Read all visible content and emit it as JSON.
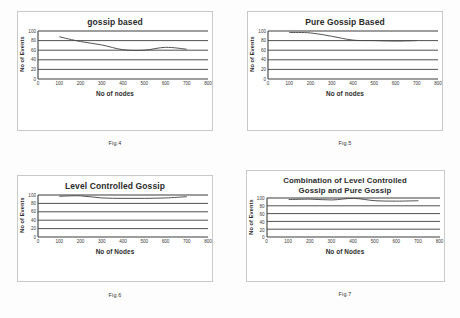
{
  "page": {
    "background": "#fdfdfd",
    "figure_count": 4
  },
  "figures": [
    {
      "caption": "Fig.4",
      "chart_data": {
        "type": "line",
        "title": "gossip based",
        "xlabel": "No of nodes",
        "ylabel": "No of Events",
        "xlim": [
          0,
          800
        ],
        "ylim": [
          0,
          100
        ],
        "xticks": [
          0,
          100,
          200,
          300,
          400,
          500,
          600,
          700,
          800
        ],
        "yticks": [
          0,
          20,
          40,
          60,
          80,
          100
        ],
        "grid": "horizontal",
        "legend": "none",
        "line_color": "#4a4a4a",
        "series": [
          {
            "name": "gossip based",
            "x": [
              100,
              200,
              300,
              400,
              500,
              600,
              700
            ],
            "values": [
              88,
              78,
              71,
              61,
              60,
              66,
              62
            ]
          }
        ]
      }
    },
    {
      "caption": "Fig.5",
      "chart_data": {
        "type": "line",
        "title": "Pure Gossip Based",
        "xlabel": "No of nodes",
        "ylabel": "No of Events",
        "xlim": [
          0,
          800
        ],
        "ylim": [
          0,
          100
        ],
        "xticks": [
          0,
          100,
          200,
          300,
          400,
          500,
          600,
          700,
          800
        ],
        "yticks": [
          0,
          20,
          40,
          60,
          80,
          100
        ],
        "grid": "horizontal",
        "legend": "none",
        "line_color": "#4a4a4a",
        "series": [
          {
            "name": "Pure Gossip Based",
            "x": [
              100,
              200,
              300,
              400,
              500,
              600,
              700
            ],
            "values": [
              97,
              96,
              89,
              81,
              80,
              79,
              80
            ]
          }
        ]
      }
    },
    {
      "caption": "Fig.6",
      "chart_data": {
        "type": "line",
        "title": "Level Controlled Gossip",
        "xlabel": "No of Nodes",
        "ylabel": "No of Events",
        "xlim": [
          0,
          800
        ],
        "ylim": [
          0,
          100
        ],
        "xticks": [
          0,
          100,
          200,
          300,
          400,
          500,
          600,
          700,
          800
        ],
        "yticks": [
          0,
          20,
          40,
          60,
          80,
          100
        ],
        "grid": "horizontal",
        "legend": "none",
        "line_color": "#4a4a4a",
        "series": [
          {
            "name": "Level Controlled Gossip",
            "x": [
              100,
              200,
              300,
              400,
              500,
              600,
              700
            ],
            "values": [
              97,
              98,
              93,
              92,
              92,
              93,
              96
            ]
          }
        ]
      }
    },
    {
      "caption": "Fig.7",
      "chart_data": {
        "type": "line",
        "title_line1": "Combination of Level Controlled",
        "title_line2": "Gossip and Pure Gossip",
        "title": "Combination of Level Controlled Gossip and Pure Gossip",
        "xlabel": "No of Nodes",
        "ylabel": "No of Events",
        "xlim": [
          0,
          800
        ],
        "ylim": [
          0,
          100
        ],
        "xticks": [
          0,
          100,
          200,
          300,
          400,
          500,
          600,
          700,
          800
        ],
        "yticks": [
          0,
          20,
          40,
          60,
          80,
          100
        ],
        "grid": "horizontal",
        "legend": "none",
        "line_color": "#4a4a4a",
        "series": [
          {
            "name": "Combination of Level Controlled Gossip and Pure Gossip",
            "x": [
              100,
              200,
              300,
              400,
              500,
              600,
              700
            ],
            "values": [
              96,
              97,
              95,
              99,
              93,
              92,
              93
            ]
          }
        ]
      }
    }
  ]
}
